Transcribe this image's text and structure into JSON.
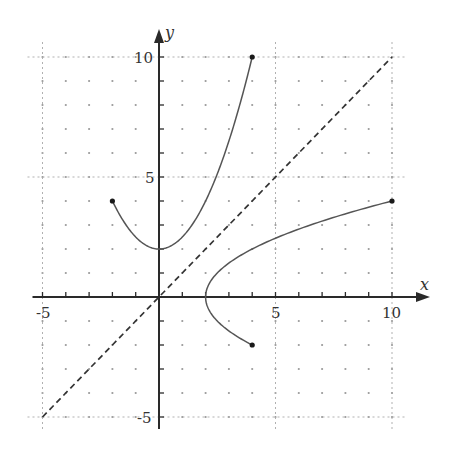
{
  "chart_data": {
    "type": "line",
    "title": "",
    "xlabel": "x",
    "ylabel": "y",
    "xlim": [
      -5,
      10
    ],
    "ylim": [
      -5,
      10
    ],
    "grid": "dotted major lines at multiples of 5, dot lattice at integer points",
    "x_tick_labels": [
      "-5",
      "5",
      "10"
    ],
    "y_tick_labels": [
      "10",
      "5",
      "-5"
    ],
    "x_ticks": [
      -5,
      -4,
      -3,
      -2,
      -1,
      1,
      2,
      3,
      4,
      5,
      6,
      7,
      8,
      9,
      10
    ],
    "y_ticks": [
      -5,
      -4,
      -3,
      -2,
      -1,
      1,
      2,
      3,
      4,
      5,
      6,
      7,
      8,
      9,
      10
    ],
    "series": [
      {
        "name": "f(x) = x^2/2 + 2",
        "style": "solid",
        "domain": [
          -2,
          4
        ],
        "endpoints": [
          [
            -2,
            4
          ],
          [
            4,
            10
          ]
        ],
        "vertex": [
          0,
          2
        ],
        "points": [
          [
            -2,
            4
          ],
          [
            -1,
            2.5
          ],
          [
            0,
            2
          ],
          [
            1,
            2.5
          ],
          [
            2,
            4
          ],
          [
            3,
            6.5
          ],
          [
            4,
            10
          ]
        ]
      },
      {
        "name": "inverse: x = y^2/2 + 2",
        "style": "solid",
        "range": [
          -2,
          4
        ],
        "endpoints": [
          [
            4,
            -2
          ],
          [
            10,
            4
          ]
        ],
        "vertex": [
          2,
          0
        ],
        "points": [
          [
            4,
            -2
          ],
          [
            2.5,
            -1
          ],
          [
            2,
            0
          ],
          [
            2.5,
            1
          ],
          [
            4,
            2
          ],
          [
            6.5,
            3
          ],
          [
            10,
            4
          ]
        ]
      },
      {
        "name": "y = x",
        "style": "dashed",
        "points": [
          [
            -5,
            -5
          ],
          [
            10,
            10
          ]
        ]
      }
    ]
  },
  "labels": {
    "x_axis": "x",
    "y_axis": "y",
    "x_neg5": "-5",
    "x_5": "5",
    "x_10": "10",
    "y_10": "10",
    "y_5": "5",
    "y_neg5": "-5"
  }
}
